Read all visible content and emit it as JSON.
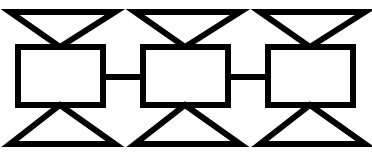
{
  "diagram": {
    "title": "Chain of three bowtie-boxed nodes",
    "background_color": "#ffffff",
    "stroke_color": "#000000",
    "fill_color": "#ffffff",
    "canvas": {
      "width": 372,
      "height": 156
    },
    "stroke_widths": {
      "rectangle": 6,
      "triangle": 6,
      "connector": 6
    },
    "units": [
      {
        "id": "unit-1",
        "label": "Unit 1",
        "rect": {
          "x": 18,
          "y": 47,
          "width": 85,
          "height": 58
        },
        "top_triangle": {
          "left_x": 10,
          "right_x": 115,
          "top_y": 12,
          "apex_x": 60,
          "apex_y": 47
        },
        "bottom_triangle": {
          "left_x": 10,
          "right_x": 115,
          "bottom_y": 144,
          "apex_x": 60,
          "apex_y": 105
        }
      },
      {
        "id": "unit-2",
        "label": "Unit 2",
        "rect": {
          "x": 143,
          "y": 47,
          "width": 85,
          "height": 58
        },
        "top_triangle": {
          "left_x": 135,
          "right_x": 240,
          "top_y": 12,
          "apex_x": 185,
          "apex_y": 47
        },
        "bottom_triangle": {
          "left_x": 135,
          "right_x": 240,
          "bottom_y": 144,
          "apex_x": 185,
          "apex_y": 105
        }
      },
      {
        "id": "unit-3",
        "label": "Unit 3",
        "rect": {
          "x": 268,
          "y": 47,
          "width": 85,
          "height": 58
        },
        "top_triangle": {
          "left_x": 260,
          "right_x": 365,
          "top_y": 12,
          "apex_x": 310,
          "apex_y": 47
        },
        "bottom_triangle": {
          "left_x": 260,
          "right_x": 365,
          "bottom_y": 144,
          "apex_x": 310,
          "apex_y": 105
        }
      }
    ],
    "connectors": [
      {
        "id": "connector-1-2",
        "from": "unit-1",
        "to": "unit-2",
        "x1": 103,
        "x2": 143,
        "y": 77,
        "thickness": 6
      },
      {
        "id": "connector-2-3",
        "from": "unit-2",
        "to": "unit-3",
        "x1": 228,
        "x2": 268,
        "y": 77,
        "thickness": 6
      }
    ]
  }
}
